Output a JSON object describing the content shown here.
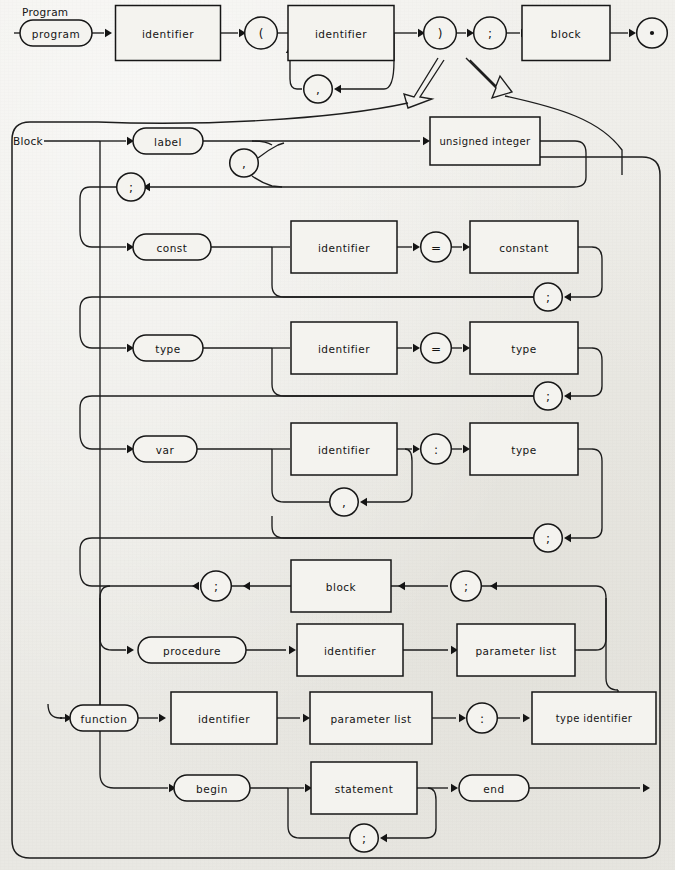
{
  "page": {
    "background_color": "#ecebe6",
    "ink_color": "#161616",
    "kind": "railroad-syntax-diagram",
    "language": "Pascal"
  },
  "sections": [
    {
      "id": "program",
      "title": "Program"
    },
    {
      "id": "block",
      "title": "Block"
    }
  ],
  "program_row": {
    "nodes": [
      {
        "name": "program-keyword",
        "shape": "oval",
        "text": "program"
      },
      {
        "name": "identifier-box-1",
        "shape": "box",
        "text": "identifier"
      },
      {
        "name": "open-paren",
        "shape": "circle",
        "text": "("
      },
      {
        "name": "identifier-box-2",
        "shape": "box",
        "text": "identifier"
      },
      {
        "name": "close-paren",
        "shape": "circle",
        "text": ")"
      },
      {
        "name": "semicolon-1",
        "shape": "circle",
        "text": ";"
      },
      {
        "name": "block-box",
        "shape": "box",
        "text": "block"
      },
      {
        "name": "period-terminal",
        "shape": "circle",
        "text": "."
      }
    ],
    "loop": {
      "name": "comma-loop-program",
      "shape": "circle",
      "text": ","
    }
  },
  "block_rows": {
    "label": {
      "keyword": "label",
      "target": "unsigned integer",
      "loop_sep": ",",
      "terminator": ";"
    },
    "const": {
      "keyword": "const",
      "left": "identifier",
      "operator": "=",
      "right": "constant",
      "terminator": ";"
    },
    "type": {
      "keyword": "type",
      "left": "identifier",
      "operator": "=",
      "right": "type",
      "terminator": ";"
    },
    "var": {
      "keyword": "var",
      "left": "identifier",
      "operator": ":",
      "right": "type",
      "loop_sep": ",",
      "terminator": ";"
    },
    "routine": {
      "recursion_box": "block",
      "semicolon_left": ";",
      "semicolon_right": ";",
      "procedure_keyword": "procedure",
      "procedure_identifier": "identifier",
      "procedure_parameter_list": "parameter list",
      "function_keyword": "function",
      "function_identifier": "identifier",
      "function_parameter_list": "parameter list",
      "function_colon": ":",
      "function_type_identifier": "type identifier"
    },
    "body": {
      "begin_keyword": "begin",
      "statement": "statement",
      "end_keyword": "end",
      "loop_sep": ";"
    }
  }
}
